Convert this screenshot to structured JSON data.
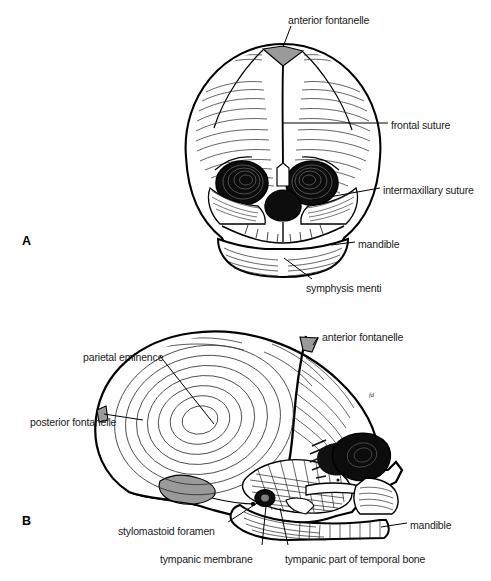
{
  "figure": {
    "type": "anatomical-illustration",
    "background_color": "#ffffff",
    "line_color": "#000000",
    "fontanelle_fill": "#9a9a9a",
    "bone_fill": "#ffffff",
    "panels": [
      {
        "id": "A",
        "letter": "A",
        "view": "anterior (frontal) view of fetal skull",
        "labels": [
          {
            "key": "anterior_fontanelle",
            "text": "anterior fontanelle",
            "x": 288,
            "y": 14
          },
          {
            "key": "frontal_suture",
            "text": "frontal suture",
            "x": 391,
            "y": 119
          },
          {
            "key": "intermaxillary_suture",
            "text": "intermaxillary suture",
            "x": 383,
            "y": 184
          },
          {
            "key": "mandible",
            "text": "mandible",
            "x": 358,
            "y": 238
          },
          {
            "key": "symphysis_menti",
            "text": "symphysis menti",
            "x": 306,
            "y": 282
          }
        ]
      },
      {
        "id": "B",
        "letter": "B",
        "view": "lateral (side) view of fetal skull",
        "artist_mark": "fd",
        "labels": [
          {
            "key": "anterior_fontanelle",
            "text": "anterior fontanelle",
            "x": 322,
            "y": 331
          },
          {
            "key": "parietal_eminence",
            "text": "parietal eminence",
            "x": 83,
            "y": 351
          },
          {
            "key": "posterior_fontanelle",
            "text": "posterior fontanelle",
            "x": 30,
            "y": 416
          },
          {
            "key": "stylomastoid_foramen",
            "text": "stylomastoid foramen",
            "x": 118,
            "y": 525
          },
          {
            "key": "tympanic_membrane",
            "text": "tympanic membrane",
            "x": 160,
            "y": 553
          },
          {
            "key": "tympanic_part_of_temporal_bone",
            "text": "tympanic part of temporal bone",
            "x": 285,
            "y": 553
          },
          {
            "key": "mandible",
            "text": "mandible",
            "x": 410,
            "y": 519
          }
        ]
      }
    ]
  }
}
